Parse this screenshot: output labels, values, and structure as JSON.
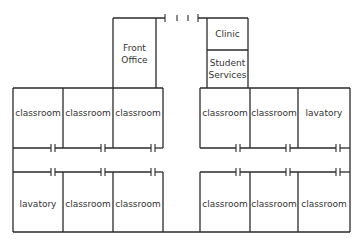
{
  "diagram": {
    "type": "floor-plan",
    "line_color": "#2a2a2a",
    "top_wing": {
      "front_office": {
        "label_line1": "Front",
        "label_line2": "Office"
      },
      "clinic": {
        "label": "Clinic"
      },
      "student_services": {
        "label_line1": "Student",
        "label_line2": "Services"
      },
      "entrance_doors": 4
    },
    "upper_row": [
      {
        "label": "classroom"
      },
      {
        "label": "classroom"
      },
      {
        "label": "classroom"
      },
      {
        "label": "classroom"
      },
      {
        "label": "classroom"
      },
      {
        "label": "lavatory"
      }
    ],
    "lower_row": [
      {
        "label": "lavatory"
      },
      {
        "label": "classroom"
      },
      {
        "label": "classroom"
      },
      {
        "label": "classroom"
      },
      {
        "label": "classroom"
      },
      {
        "label": "classroom"
      }
    ]
  }
}
